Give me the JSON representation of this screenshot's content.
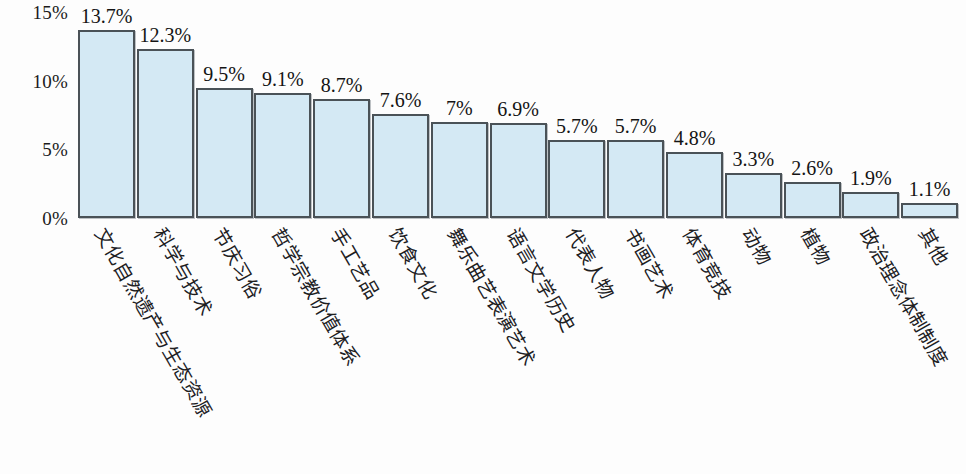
{
  "chart_data": {
    "type": "bar",
    "title": "",
    "subtitle": "",
    "xlabel": "",
    "ylabel": "",
    "ylim": [
      0,
      15
    ],
    "yticks": [
      "0%",
      "5%",
      "10%",
      "15%"
    ],
    "ytick_values": [
      0,
      5,
      10,
      15
    ],
    "grid": false,
    "legend": null,
    "bar_color": "#d4e9f4",
    "bar_border_color": "#4a5257",
    "categories": [
      "文化自然遗产与生态资源",
      "科学与技术",
      "节庆习俗",
      "哲学宗教价值体系",
      "手工艺品",
      "饮食文化",
      "舞乐曲艺表演艺术",
      "语言文学历史",
      "代表人物",
      "书画艺术",
      "体育竞技",
      "动物",
      "植物",
      "政治理念体制制度",
      "其他"
    ],
    "values": [
      13.7,
      12.3,
      9.5,
      9.1,
      8.7,
      7.6,
      7,
      6.9,
      5.7,
      5.7,
      4.8,
      3.3,
      2.6,
      1.9,
      1.1
    ],
    "data_labels": [
      "13.7%",
      "12.3%",
      "9.5%",
      "9.1%",
      "8.7%",
      "7.6%",
      "7%",
      "6.9%",
      "5.7%",
      "5.7%",
      "4.8%",
      "3.3%",
      "2.6%",
      "1.9%",
      "1.1%"
    ]
  }
}
